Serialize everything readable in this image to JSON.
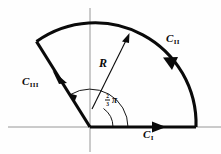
{
  "figure": {
    "name": "complex-contour-sector-diagram",
    "background": "#fefefe",
    "ink_color": "#0a0a0a",
    "axis_color": "#8d8d8d",
    "origin": {
      "x": 90,
      "y": 127
    },
    "radius": 101,
    "sector_angle_degrees": 122
  },
  "axes": {
    "horizontal": {
      "label": "real-axis",
      "x1": 8,
      "y1": 127,
      "x2": 221,
      "y2": 127
    },
    "vertical": {
      "label": "imaginary-axis",
      "x1": 90,
      "y1": 8,
      "x2": 90,
      "y2": 152
    }
  },
  "contour": {
    "segments": [
      {
        "id": "C1",
        "label": "C",
        "subscript": "I",
        "kind": "straight",
        "role": "outbound-along-positive-real-axis",
        "direction": "rightward",
        "label_x": 143,
        "label_y": 132
      },
      {
        "id": "C2",
        "label": "C",
        "subscript": "II",
        "kind": "arc",
        "role": "circular-arc-of-radius-R",
        "direction": "counterclockwise",
        "label_x": 166,
        "label_y": 36
      },
      {
        "id": "C3",
        "label": "C",
        "subscript": "III",
        "kind": "straight",
        "role": "return-ray-to-origin",
        "direction": "toward-origin",
        "label_x": 25,
        "label_y": 79
      }
    ]
  },
  "annotations": {
    "radius": {
      "label": "R",
      "label_x": 101,
      "label_y": 62,
      "arrow_from": {
        "x": 93,
        "y": 104
      },
      "arrow_to": {
        "x": 129,
        "y": 35
      }
    },
    "angle": {
      "numerator": "2",
      "denominator": "3",
      "symbol": "π",
      "label_x": 106,
      "label_y": 97,
      "sweep": "from positive real axis counterclockwise to C-III ray"
    }
  }
}
